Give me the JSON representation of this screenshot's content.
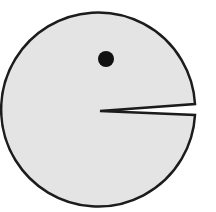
{
  "figure": {
    "label": "Pac-Man shaped figure",
    "background": "#ffffff",
    "body": {
      "shape": "circle-with-wedge",
      "cx": 101,
      "cy": 110,
      "r": 97,
      "fill": "#e4e4e4",
      "stroke": "#1c1c1c",
      "stroke_width": 2.5
    },
    "mouth": {
      "apex": [
        100,
        111
      ],
      "upper_edge": [
        195,
        104
      ],
      "lower_edge": [
        195,
        115
      ]
    },
    "eye": {
      "cx": 106,
      "cy": 59,
      "r": 8,
      "fill": "#111111"
    }
  }
}
